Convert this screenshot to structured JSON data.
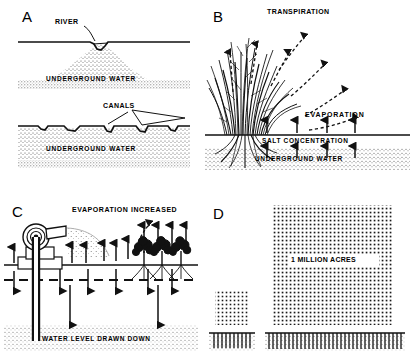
{
  "figure": {
    "ink_color": "#111111",
    "stipple_color": "#555555",
    "background": "#ffffff"
  },
  "panels": [
    {
      "id": "A",
      "letter": "A",
      "name": "natural-river-and-canals",
      "labels": {
        "river": "RIVER",
        "canals": "CANALS",
        "underground_water_top": "UNDERGROUND  WATER",
        "underground_water_bottom": "UNDERGROUND  WATER"
      }
    },
    {
      "id": "B",
      "letter": "B",
      "name": "phreatophyte-transpiration",
      "labels": {
        "transpiration": "TRANSPIRATION",
        "evaporation": "EVAPORATION",
        "salt_concentration": "SALT  CONCENTRATION",
        "underground_water": "UNDERGROUND  WATER"
      }
    },
    {
      "id": "C",
      "letter": "C",
      "name": "pumping-drawdown",
      "labels": {
        "evaporation_increased": "EVAPORATION  INCREASED",
        "water_level_drawn_down": "WATER  LEVEL  DRAWN  DOWN"
      }
    },
    {
      "id": "D",
      "letter": "D",
      "name": "acreage-comparison",
      "labels": {
        "million_acres": "1 MILLION  ACRES"
      }
    }
  ]
}
